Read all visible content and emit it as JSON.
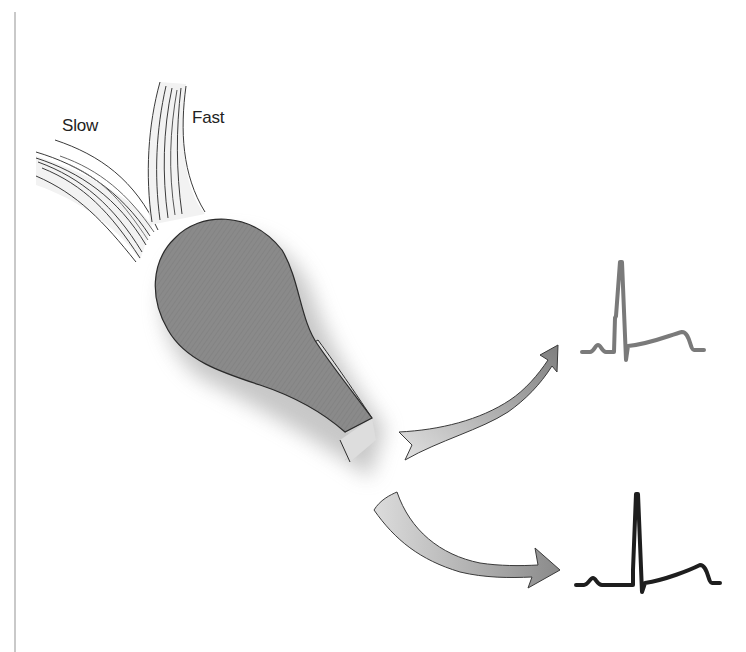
{
  "diagram": {
    "labels": {
      "slow": "Slow",
      "fast": "Fast"
    },
    "elements": {
      "muscle": "muscle-belly",
      "tendon": "tendon",
      "slow_fibers": "slow-fiber-bundle",
      "fast_fibers": "fast-fiber-bundle",
      "arrow_upper": "curved-arrow-up",
      "arrow_lower": "curved-arrow-down",
      "ecg_upper": "ecg-waveform-gray",
      "ecg_lower": "ecg-waveform-black"
    },
    "colors": {
      "muscle_fill": "#8a8a8a",
      "fiber_fill": "#f1f1f1",
      "fiber_stroke": "#3a3a3a",
      "arrow_fill_light": "#d6d6d6",
      "arrow_fill_dark": "#8e8e8e",
      "ecg_upper": "#7a7a7a",
      "ecg_lower": "#1e1e1e",
      "rule": "#c9c9c9"
    }
  }
}
